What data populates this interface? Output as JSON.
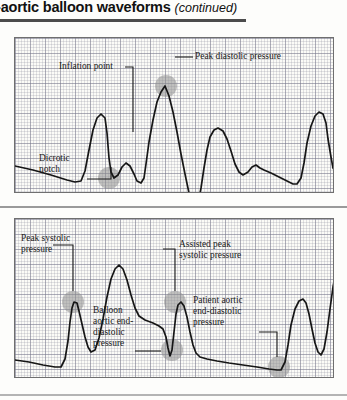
{
  "header": {
    "title": "-aortic balloon waveforms",
    "continued": "(continued)"
  },
  "panels": [
    {
      "id": "panel-top",
      "name": "unassisted-and-assisted-arterial-waveform",
      "annotations": [
        {
          "name": "inflation-point",
          "text": "Inflation point"
        },
        {
          "name": "peak-diastolic-pressure",
          "text": "Peak diastolic pressure"
        },
        {
          "name": "dicrotic-notch-line1",
          "text": "Dicrotic"
        },
        {
          "name": "dicrotic-notch-line2",
          "text": "notch"
        }
      ]
    },
    {
      "id": "panel-bottom",
      "name": "assisted-balloon-pressure-waveform",
      "annotations": [
        {
          "name": "peak-systolic-line1",
          "text": "Peak systolic"
        },
        {
          "name": "peak-systolic-line2",
          "text": "pressure"
        },
        {
          "name": "assisted-peak-line1",
          "text": "Assisted peak"
        },
        {
          "name": "assisted-peak-line2",
          "text": "systolic pressure"
        },
        {
          "name": "balloon-aed-line1",
          "text": "Balloon"
        },
        {
          "name": "balloon-aed-line2",
          "text": "aortic end-"
        },
        {
          "name": "balloon-aed-line3",
          "text": "diastolic"
        },
        {
          "name": "balloon-aed-line4",
          "text": "pressure"
        },
        {
          "name": "patient-aed-line1",
          "text": "Patient aortic"
        },
        {
          "name": "patient-aed-line2",
          "text": "end-diastolic"
        },
        {
          "name": "patient-aed-line3",
          "text": "pressure"
        }
      ]
    }
  ],
  "colors": {
    "rule_dark": "#4c4c4c",
    "rule_mid": "#9a9a9a",
    "rule_light": "#b4b4b4",
    "grid_major": "#7878",
    "trace": "#161616",
    "marker": "#8e8e8e",
    "paper": "#fbfbf7"
  },
  "chart_data": [
    {
      "type": "line",
      "title": "Intra-aortic balloon waveform — unassisted vs augmented",
      "xlabel": "",
      "ylabel": "Arterial pressure",
      "grid": true,
      "legend": null,
      "markers": [
        {
          "label": "Dicrotic notch",
          "x": 94,
          "y": 140
        },
        {
          "label": "Peak diastolic pressure",
          "x": 151,
          "y": 48
        }
      ],
      "path": "M 0,128 L 18,132 L 36,137 L 52,142 L 60,144 L 66,143 L 70,133 L 74,112 L 78,92 L 82,80 L 86,76 L 90,80 L 92,95 L 94,120 L 96,134 L 99,140 L 103,137 L 107,129 L 111,125 L 115,128 L 119,136 L 122,143 L 126,145 L 129,140 L 131,126 L 134,104 L 138,82 L 142,64 L 146,54 L 150,48 L 154,58 L 158,74 L 162,94 L 166,116 L 170,136 L 174,155 L 177,167 L 180,172 L 183,166 L 186,150 L 189,130 L 192,112 L 195,99 L 199,92 L 203,90 L 208,93 L 212,101 L 216,113 L 220,126 L 224,134 L 228,137 L 233,134 L 237,129 L 241,127 L 245,130 L 249,132 L 256,135 L 264,139 L 272,143 L 278,146 L 282,146 L 286,140 L 289,125 L 292,105 L 296,88 L 300,78 L 304,74 L 308,76 L 311,85 L 313,101 L 316,119 L 318,130 L 321,134 L 325,130 L 329,124 L 333,122 L 337,126 L 341,130 L 346,132"
    },
    {
      "type": "line",
      "title": "Intra-aortic balloon waveform — assisted pressures",
      "xlabel": "",
      "ylabel": "Arterial pressure",
      "grid": true,
      "legend": null,
      "markers": [
        {
          "label": "Peak systolic pressure",
          "x": 58,
          "y": 83
        },
        {
          "label": "Balloon aortic end-diastolic pressure",
          "x": 157,
          "y": 131
        },
        {
          "label": "Assisted peak systolic pressure",
          "x": 160,
          "y": 83
        },
        {
          "label": "Patient aortic end-diastolic pressure",
          "x": 264,
          "y": 143
        }
      ],
      "path": "M 0,141 L 14,143 L 28,146 L 40,148 L 46,148 L 50,140 L 53,122 L 55,103 L 57,89 L 59,83 L 62,84 L 64,92 L 67,105 L 70,118 L 73,128 L 76,133 L 80,131 L 84,119 L 88,100 L 92,78 L 96,60 L 100,50 L 104,46 L 108,50 L 112,61 L 116,76 L 120,89 L 124,97 L 130,101 L 138,104 L 144,107 L 148,110 L 151,118 L 153,129 L 155,137 L 157,131 L 159,113 L 161,95 L 163,86 L 166,83 L 169,87 L 172,98 L 175,113 L 178,126 L 181,134 L 185,138 L 192,140 L 202,142 L 214,144 L 228,146 L 242,148 L 254,150 L 262,151 L 266,151 L 270,143 L 273,126 L 276,106 L 280,90 L 284,82 L 288,80 L 291,84 L 294,95 L 297,110 L 300,124 L 303,133 L 306,136 L 309,130 L 312,113 L 315,90 L 318,68 L 321,52 L 324,44 L 327,43 L 330,49 L 333,62 L 336,80 L 339,98 L 342,112 L 346,122"
    }
  ]
}
